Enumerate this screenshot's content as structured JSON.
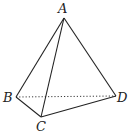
{
  "diagram": {
    "type": "tetrahedron",
    "stroke_color": "#222222",
    "vertices": [
      {
        "id": "A",
        "label": "A",
        "x": 64,
        "y": 18,
        "label_x": 58,
        "label_y": 13
      },
      {
        "id": "B",
        "label": "B",
        "x": 16,
        "y": 97,
        "label_x": 3,
        "label_y": 102
      },
      {
        "id": "C",
        "label": "C",
        "x": 41,
        "y": 117,
        "label_x": 36,
        "label_y": 131
      },
      {
        "id": "D",
        "label": "D",
        "x": 116,
        "y": 96,
        "label_x": 117,
        "label_y": 102
      }
    ],
    "edges": [
      {
        "from": "A",
        "to": "B",
        "style": "solid"
      },
      {
        "from": "A",
        "to": "C",
        "style": "solid"
      },
      {
        "from": "A",
        "to": "D",
        "style": "solid"
      },
      {
        "from": "B",
        "to": "C",
        "style": "solid"
      },
      {
        "from": "C",
        "to": "D",
        "style": "solid"
      },
      {
        "from": "B",
        "to": "D",
        "style": "dotted"
      }
    ]
  }
}
